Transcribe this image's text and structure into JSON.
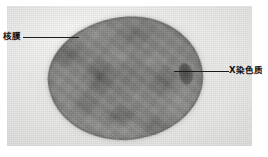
{
  "figure": {
    "type": "micrograph",
    "width": 268,
    "height": 157,
    "background_color": "#ffffff",
    "panel_color": "#e9e9e7"
  },
  "annotations": [
    {
      "id": "nuclear-membrane",
      "label": "核膜",
      "side": "left",
      "leader_from_x": 23,
      "leader_to_x": 79,
      "leader_y": 37
    },
    {
      "id": "x-chromatin",
      "label": "X染色质",
      "side": "right",
      "leader_from_x": 174,
      "leader_to_x": 229,
      "leader_y": 71
    }
  ],
  "structures": {
    "nucleus": {
      "name": "nucleus",
      "fill_color": "#868684",
      "edge_color": "#5c5c5a"
    },
    "barr_body": {
      "name": "x-chromatin-barr-body",
      "fill_color": "#4a4a48"
    }
  }
}
